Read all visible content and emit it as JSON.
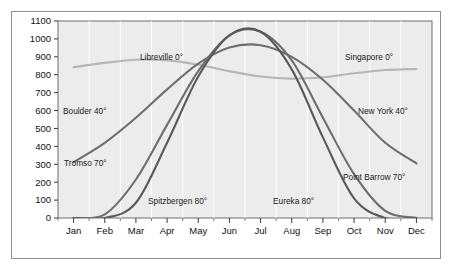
{
  "chart_data": {
    "type": "line",
    "title": "",
    "xlabel": "Month",
    "ylabel": "Langleys per day",
    "x": [
      "Jan",
      "Feb",
      "Mar",
      "Apr",
      "May",
      "Jun",
      "Jul",
      "Aug",
      "Sep",
      "Oct",
      "Nov",
      "Dec"
    ],
    "categories": [
      "Jan",
      "Feb",
      "Mar",
      "Apr",
      "May",
      "Jun",
      "Jul",
      "Aug",
      "Sep",
      "Oct",
      "Nov",
      "Dec"
    ],
    "xtick_labels": [
      "Jan",
      "Feb",
      "Mar",
      "Apr",
      "May",
      "Jun",
      "Jul",
      "Aug",
      "Sep",
      "Oct",
      "Nov",
      "Dec"
    ],
    "ytick_labels": [
      "1100",
      "1000",
      "900",
      "800",
      "700",
      "600",
      "500",
      "400",
      "300",
      "200",
      "100",
      "0"
    ],
    "ytick_values": [
      1100,
      1000,
      900,
      800,
      700,
      600,
      500,
      400,
      300,
      200,
      100,
      0
    ],
    "ylim": [
      0,
      1100
    ],
    "grid": "vertical",
    "legend": "inline-annotations",
    "plot_background": "#ececec",
    "series": [
      {
        "name": "Libreville 0°",
        "label": "Libreville 0°",
        "color": "#b6b6b6",
        "values": [
          842,
          866,
          884,
          880,
          856,
          820,
          790,
          778,
          786,
          808,
          826,
          832
        ],
        "label_x": 140,
        "label_y": 52
      },
      {
        "name": "Singapore 0°",
        "label": "Singapore 0°",
        "color": "#b6b6b6",
        "values": [
          842,
          866,
          884,
          880,
          856,
          820,
          790,
          778,
          786,
          808,
          826,
          832
        ],
        "label_x": 345,
        "label_y": 52
      },
      {
        "name": "Boulder 40°",
        "label": "Boulder 40°",
        "color": "#6e6e6e",
        "values": [
          312,
          420,
          560,
          718,
          862,
          952,
          965,
          900,
          772,
          600,
          420,
          305
        ],
        "label_x": 63,
        "label_y": 106
      },
      {
        "name": "New York 40°",
        "label": "New York 40°",
        "color": "#6e6e6e",
        "values": [
          312,
          420,
          560,
          718,
          862,
          952,
          965,
          900,
          772,
          600,
          420,
          305
        ],
        "label_x": 358,
        "label_y": 106
      },
      {
        "name": "Tromso 70°",
        "label": "Tromso 70°",
        "color": "#6e6e6e",
        "values": [
          0,
          20,
          215,
          520,
          820,
          1020,
          1040,
          880,
          560,
          245,
          40,
          0
        ],
        "label_x": 64,
        "label_y": 158
      },
      {
        "name": "Point Barrow 70°",
        "label": "Point Barrow 70°",
        "color": "#6e6e6e",
        "values": [
          0,
          20,
          215,
          520,
          820,
          1020,
          1040,
          880,
          560,
          245,
          40,
          0
        ],
        "label_x": 343,
        "label_y": 172
      },
      {
        "name": "Spitzbergen 80°",
        "label": "Spitzbergen 80°",
        "color": "#5a5a5a",
        "values": [
          0,
          0,
          85,
          420,
          790,
          1020,
          1040,
          830,
          450,
          110,
          0,
          0
        ],
        "label_x": 148,
        "label_y": 196
      },
      {
        "name": "Eureka 80°",
        "label": "Eureka 80°",
        "color": "#5a5a5a",
        "values": [
          0,
          0,
          85,
          420,
          790,
          1020,
          1040,
          830,
          450,
          110,
          0,
          0
        ],
        "label_x": 273,
        "label_y": 196
      }
    ]
  }
}
